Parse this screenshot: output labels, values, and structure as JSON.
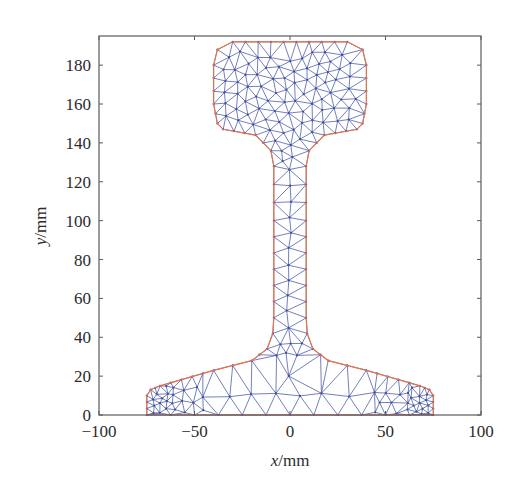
{
  "chart_data": {
    "type": "scatter",
    "subtype": "finite-element triangular mesh of rail cross-section",
    "title": "",
    "xlabel": "x/mm",
    "ylabel": "y/mm",
    "xlabel_var": "x",
    "xlabel_unit": "/mm",
    "ylabel_var": "y",
    "ylabel_unit": "/mm",
    "xlim": [
      -100,
      100
    ],
    "ylim": [
      0,
      195
    ],
    "xticks": [
      -100,
      -50,
      0,
      50,
      100
    ],
    "yticks": [
      0,
      20,
      40,
      60,
      80,
      100,
      120,
      140,
      160,
      180
    ],
    "xtick_labels": [
      "−100",
      "−50",
      "0",
      "50",
      "100"
    ],
    "ytick_labels": [
      "0",
      "20",
      "40",
      "60",
      "80",
      "100",
      "120",
      "140",
      "160",
      "180"
    ],
    "grid": false,
    "legend": null,
    "series": [
      {
        "name": "boundary",
        "color": "#e8734a",
        "description": "rail profile outline (head, web, foot)",
        "outline_mm": [
          [
            -75,
            0
          ],
          [
            75,
            0
          ],
          [
            75,
            10
          ],
          [
            73,
            13
          ],
          [
            68,
            15
          ],
          [
            40,
            23
          ],
          [
            20,
            28
          ],
          [
            12,
            34
          ],
          [
            9,
            42
          ],
          [
            8.5,
            50
          ],
          [
            8.5,
            100
          ],
          [
            8.5,
            128
          ],
          [
            10,
            136
          ],
          [
            18,
            144
          ],
          [
            35,
            147
          ],
          [
            38,
            150
          ],
          [
            40,
            160
          ],
          [
            40,
            180
          ],
          [
            38,
            188
          ],
          [
            30,
            192
          ],
          [
            -30,
            192
          ],
          [
            -38,
            188
          ],
          [
            -40,
            180
          ],
          [
            -40,
            160
          ],
          [
            -38,
            150
          ],
          [
            -35,
            147
          ],
          [
            -18,
            144
          ],
          [
            -10,
            136
          ],
          [
            -8.5,
            128
          ],
          [
            -8.5,
            100
          ],
          [
            -8.5,
            50
          ],
          [
            -9,
            42
          ],
          [
            -12,
            34
          ],
          [
            -20,
            28
          ],
          [
            -40,
            23
          ],
          [
            -68,
            15
          ],
          [
            -73,
            13
          ],
          [
            -75,
            10
          ]
        ]
      },
      {
        "name": "mesh",
        "color": "#3c4ea0",
        "description": "triangular finite-element mesh; dense in head and foot tips, coarse in web and foot center"
      }
    ],
    "regions": {
      "head": {
        "x": [
          -40,
          40
        ],
        "y": [
          147,
          192
        ]
      },
      "web": {
        "x": [
          -8.5,
          8.5
        ],
        "y": [
          34,
          140
        ]
      },
      "foot": {
        "x": [
          -75,
          75
        ],
        "y": [
          0,
          28
        ]
      }
    }
  },
  "colors": {
    "axis": "#5a5a5a",
    "boundary": "#e8734a",
    "mesh": "#3c4ea0",
    "background": "#ffffff"
  },
  "plot_area_px": {
    "left": 99,
    "right": 481,
    "top": 36,
    "bottom": 415
  }
}
